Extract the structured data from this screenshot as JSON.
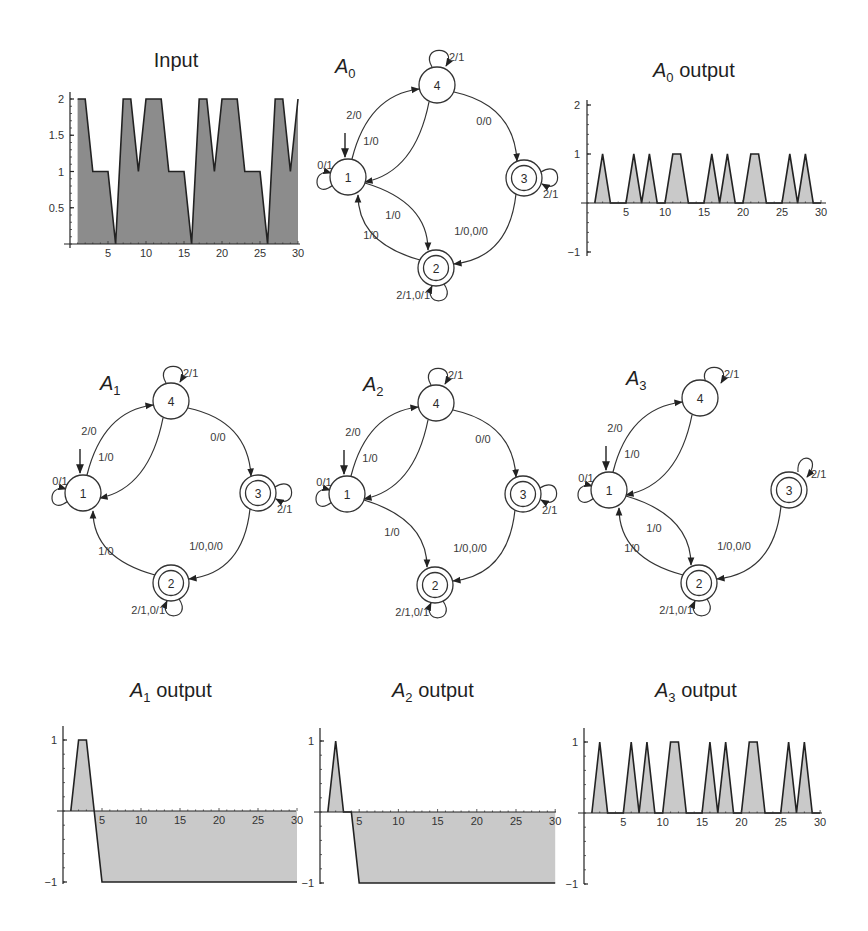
{
  "figure": {
    "panels_top_row": [
      "Input",
      "A0",
      "A0 output"
    ],
    "panels_middle_row": [
      "A1",
      "A2",
      "A3"
    ],
    "panels_bottom_row": [
      "A1 output",
      "A2 output",
      "A3 output"
    ]
  },
  "titles": {
    "input": {
      "text": "Input"
    },
    "a0_output": {
      "main": "A",
      "sub": "0",
      "rest": " output"
    },
    "a1_output": {
      "main": "A",
      "sub": "1",
      "rest": " output"
    },
    "a2_output": {
      "main": "A",
      "sub": "2",
      "rest": " output"
    },
    "a3_output": {
      "main": "A",
      "sub": "3",
      "rest": " output"
    },
    "a0": {
      "main": "A",
      "sub": "0"
    },
    "a1": {
      "main": "A",
      "sub": "1"
    },
    "a2": {
      "main": "A",
      "sub": "2"
    },
    "a3": {
      "main": "A",
      "sub": "3"
    }
  },
  "colors": {
    "input_fill": "#8c8c8c",
    "output_fill": "#c9c9c9",
    "line": "#222222"
  },
  "chart_data": [
    {
      "id": "input",
      "type": "area",
      "title": "Input",
      "x": [
        1,
        2,
        3,
        4,
        5,
        6,
        7,
        8,
        9,
        10,
        11,
        12,
        13,
        14,
        15,
        16,
        17,
        18,
        19,
        20,
        21,
        22,
        23,
        24,
        25,
        26,
        27,
        28,
        29,
        30
      ],
      "values": [
        2,
        2,
        1,
        1,
        1,
        0,
        2,
        2,
        1,
        2,
        2,
        2,
        1,
        1,
        1,
        0,
        2,
        2,
        1,
        2,
        2,
        2,
        1,
        1,
        1,
        0,
        2,
        2,
        1,
        2
      ],
      "xticks": [
        5,
        10,
        15,
        20,
        25,
        30
      ],
      "yticks": [
        0.5,
        1,
        1.5,
        2
      ],
      "ytick_labels": [
        "0.5",
        "1",
        "1.5",
        "2"
      ],
      "ylim": [
        0,
        2
      ],
      "xlim": [
        0,
        30
      ],
      "grid": false
    },
    {
      "id": "a0_output",
      "type": "area",
      "title": "A0 output",
      "x": [
        1,
        2,
        3,
        4,
        5,
        6,
        7,
        8,
        9,
        10,
        11,
        12,
        13,
        14,
        15,
        16,
        17,
        18,
        19,
        20,
        21,
        22,
        23,
        24,
        25,
        26,
        27,
        28,
        29,
        30
      ],
      "values": [
        0,
        1,
        0,
        0,
        0,
        1,
        0,
        1,
        0,
        0,
        1,
        1,
        0,
        0,
        0,
        1,
        0,
        1,
        0,
        0,
        1,
        1,
        0,
        0,
        0,
        1,
        0,
        1,
        0,
        0
      ],
      "xticks": [
        5,
        10,
        15,
        20,
        25,
        30
      ],
      "yticks": [
        -1,
        1,
        2
      ],
      "ytick_labels": [
        "-1",
        "1",
        "2"
      ],
      "ylim": [
        -1,
        2
      ],
      "xlim": [
        0,
        30
      ],
      "grid": false
    },
    {
      "id": "a1_output",
      "type": "area",
      "title": "A1 output",
      "x": [
        1,
        2,
        3,
        4,
        5,
        6,
        7,
        8,
        9,
        10,
        11,
        12,
        13,
        14,
        15,
        16,
        17,
        18,
        19,
        20,
        21,
        22,
        23,
        24,
        25,
        26,
        27,
        28,
        29,
        30
      ],
      "values": [
        0,
        1,
        1,
        0,
        -1,
        -1,
        -1,
        -1,
        -1,
        -1,
        -1,
        -1,
        -1,
        -1,
        -1,
        -1,
        -1,
        -1,
        -1,
        -1,
        -1,
        -1,
        -1,
        -1,
        -1,
        -1,
        -1,
        -1,
        -1,
        -1
      ],
      "xticks": [
        5,
        10,
        15,
        20,
        25,
        30
      ],
      "yticks": [
        -1,
        1
      ],
      "ytick_labels": [
        "-1",
        "1"
      ],
      "ylim": [
        -1,
        1
      ],
      "xlim": [
        0,
        30
      ],
      "grid": false
    },
    {
      "id": "a2_output",
      "type": "area",
      "title": "A2 output",
      "x": [
        1,
        2,
        3,
        4,
        5,
        6,
        7,
        8,
        9,
        10,
        11,
        12,
        13,
        14,
        15,
        16,
        17,
        18,
        19,
        20,
        21,
        22,
        23,
        24,
        25,
        26,
        27,
        28,
        29,
        30
      ],
      "values": [
        0,
        1,
        0,
        0,
        -1,
        -1,
        -1,
        -1,
        -1,
        -1,
        -1,
        -1,
        -1,
        -1,
        -1,
        -1,
        -1,
        -1,
        -1,
        -1,
        -1,
        -1,
        -1,
        -1,
        -1,
        -1,
        -1,
        -1,
        -1,
        -1
      ],
      "xticks": [
        5,
        10,
        15,
        20,
        25,
        30
      ],
      "yticks": [
        -1,
        1
      ],
      "ytick_labels": [
        "-1",
        "1"
      ],
      "ylim": [
        -1,
        1
      ],
      "xlim": [
        0,
        30
      ],
      "grid": false
    },
    {
      "id": "a3_output",
      "type": "area",
      "title": "A3 output",
      "x": [
        1,
        2,
        3,
        4,
        5,
        6,
        7,
        8,
        9,
        10,
        11,
        12,
        13,
        14,
        15,
        16,
        17,
        18,
        19,
        20,
        21,
        22,
        23,
        24,
        25,
        26,
        27,
        28,
        29,
        30
      ],
      "values": [
        0,
        1,
        0,
        0,
        0,
        1,
        0,
        1,
        0,
        0,
        1,
        1,
        0,
        0,
        0,
        1,
        0,
        1,
        0,
        0,
        1,
        1,
        0,
        0,
        0,
        1,
        0,
        1,
        0,
        0
      ],
      "xticks": [
        5,
        10,
        15,
        20,
        25,
        30
      ],
      "yticks": [
        -1,
        1
      ],
      "ytick_labels": [
        "-1",
        "1"
      ],
      "ylim": [
        -1,
        1
      ],
      "xlim": [
        0,
        30
      ],
      "grid": false
    }
  ],
  "automata": {
    "a0": {
      "states": [
        "1",
        "2",
        "3",
        "4"
      ],
      "initial": "1",
      "accepting": [
        "2",
        "3"
      ],
      "transitions": [
        {
          "from": "1",
          "to": "1",
          "label": "0/1"
        },
        {
          "from": "1",
          "to": "4",
          "label": "2/0"
        },
        {
          "from": "4",
          "to": "1",
          "label": "1/0"
        },
        {
          "from": "4",
          "to": "4",
          "label": "2/1"
        },
        {
          "from": "4",
          "to": "3",
          "label": "0/0"
        },
        {
          "from": "3",
          "to": "3",
          "label": "2/1"
        },
        {
          "from": "3",
          "to": "2",
          "label": "1/0,0/0"
        },
        {
          "from": "1",
          "to": "2",
          "label": "1/0"
        },
        {
          "from": "2",
          "to": "1",
          "label": "1/0"
        },
        {
          "from": "2",
          "to": "2",
          "label": "2/1,0/1"
        }
      ]
    },
    "a1": {
      "states": [
        "1",
        "2",
        "3",
        "4"
      ],
      "initial": "1",
      "accepting": [
        "2",
        "3"
      ],
      "transitions": [
        {
          "from": "1",
          "to": "1",
          "label": "0/1"
        },
        {
          "from": "1",
          "to": "4",
          "label": "2/0"
        },
        {
          "from": "4",
          "to": "1",
          "label": "1/0"
        },
        {
          "from": "4",
          "to": "4",
          "label": "2/1"
        },
        {
          "from": "4",
          "to": "3",
          "label": "0/0"
        },
        {
          "from": "3",
          "to": "3",
          "label": "2/1"
        },
        {
          "from": "3",
          "to": "2",
          "label": "1/0,0/0"
        },
        {
          "from": "2",
          "to": "1",
          "label": "1/0"
        },
        {
          "from": "2",
          "to": "2",
          "label": "2/1,0/1"
        }
      ]
    },
    "a2": {
      "states": [
        "1",
        "2",
        "3",
        "4"
      ],
      "initial": "1",
      "accepting": [
        "2",
        "3"
      ],
      "transitions": [
        {
          "from": "1",
          "to": "1",
          "label": "0/1"
        },
        {
          "from": "1",
          "to": "4",
          "label": "2/0"
        },
        {
          "from": "4",
          "to": "1",
          "label": "1/0"
        },
        {
          "from": "4",
          "to": "4",
          "label": "2/1"
        },
        {
          "from": "4",
          "to": "3",
          "label": "0/0"
        },
        {
          "from": "3",
          "to": "3",
          "label": "2/1"
        },
        {
          "from": "3",
          "to": "2",
          "label": "1/0,0/0"
        },
        {
          "from": "1",
          "to": "2",
          "label": "1/0"
        },
        {
          "from": "2",
          "to": "2",
          "label": "2/1,0/1"
        }
      ]
    },
    "a3": {
      "states": [
        "1",
        "2",
        "3",
        "4"
      ],
      "initial": "1",
      "accepting": [
        "2",
        "3"
      ],
      "transitions": [
        {
          "from": "1",
          "to": "1",
          "label": "0/1"
        },
        {
          "from": "1",
          "to": "4",
          "label": "2/0"
        },
        {
          "from": "4",
          "to": "1",
          "label": "1/0"
        },
        {
          "from": "4",
          "to": "4",
          "label": "2/1"
        },
        {
          "from": "3",
          "to": "3",
          "label": "2/1"
        },
        {
          "from": "3",
          "to": "2",
          "label": "1/0,0/0"
        },
        {
          "from": "1",
          "to": "2",
          "label": "1/0"
        },
        {
          "from": "2",
          "to": "1",
          "label": "1/0"
        },
        {
          "from": "2",
          "to": "2",
          "label": "2/1,0/1"
        }
      ]
    }
  }
}
